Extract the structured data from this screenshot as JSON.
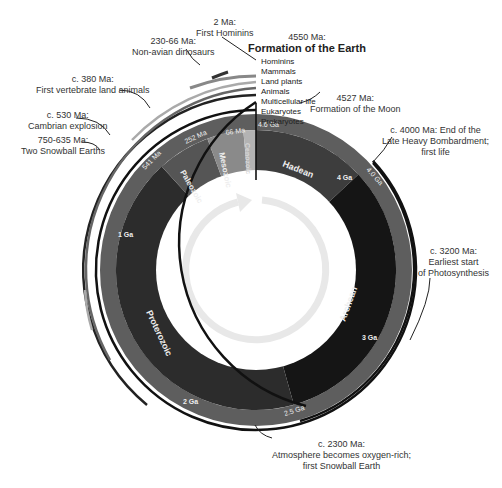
{
  "center": {
    "x": 256,
    "y": 270
  },
  "eons": [
    {
      "name": "Hadean",
      "start_ga": 4.6,
      "end_ga": 4.0,
      "color": "#3d3d3d"
    },
    {
      "name": "Archean",
      "start_ga": 4.0,
      "end_ga": 2.5,
      "color": "#151515"
    },
    {
      "name": "Proterozoic",
      "start_ga": 2.5,
      "end_ga": 0.541,
      "color": "#2c2c2c"
    }
  ],
  "eras": [
    {
      "name": "Paleozoic",
      "start_ma": 541,
      "end_ma": 252,
      "color": "#555555"
    },
    {
      "name": "Mesozoic",
      "start_ma": 252,
      "end_ma": 66,
      "color": "#8a8a8a"
    },
    {
      "name": "Cenozoic",
      "start_ma": 66,
      "end_ma": 0,
      "color": "#b3b3b3"
    }
  ],
  "band_labels": [
    "4.6 Ga",
    "4.0 Ga",
    "2.5 Ga",
    "541 Ma",
    "252 Ma",
    "66 Ma"
  ],
  "inner_labels": [
    "4 Ga",
    "3 Ga",
    "2 Ga",
    "1 Ga"
  ],
  "events": {
    "earth": {
      "time": "4550 Ma:",
      "text": "Formation of the Earth"
    },
    "moon": {
      "time": "4527 Ma:",
      "text": "Formation of the Moon"
    },
    "lhb": {
      "line1": "c. 4000 Ma: End of the",
      "line2": "Late Heavy Bombardment;",
      "line3": "first life"
    },
    "photo": {
      "line1": "c. 3200 Ma:",
      "line2": "Earliest start",
      "line3": "of Photosynthesis"
    },
    "oxygen": {
      "line1": "c. 2300 Ma:",
      "line2": "Atmosphere becomes oxygen-rich;",
      "line3": "first Snowball Earth"
    },
    "snowball": {
      "line1": "750-635 Ma:",
      "line2": "Two Snowball Earths"
    },
    "cambrian": {
      "line1": "c. 530 Ma:",
      "line2": "Cambrian explosion"
    },
    "land": {
      "line1": "c. 380 Ma:",
      "line2": "First vertebrate land animals"
    },
    "dinos": {
      "line1": "230-66 Ma:",
      "line2": "Non-avian dinosaurs"
    },
    "hominins": {
      "line1": "2 Ma:",
      "line2": "First Hominins"
    }
  },
  "life_list": [
    "Hominins",
    "Mammals",
    "Land plants",
    "Animals",
    "Multicellular life",
    "Eukaryotes",
    "Prokaryotes"
  ]
}
